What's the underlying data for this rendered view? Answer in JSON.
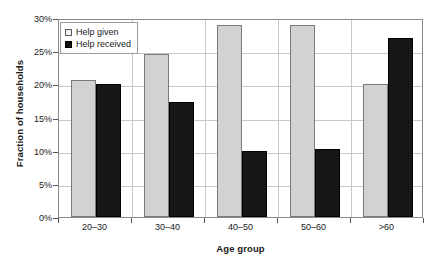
{
  "chart_data": {
    "type": "bar",
    "title": "",
    "subtitle": "",
    "xlabel": "Age group",
    "ylabel": "Fraction of households",
    "categories": [
      "20–30",
      "30–40",
      "40–50",
      "50–60",
      ">60"
    ],
    "series": [
      {
        "name": "Help given",
        "color": "#d2d2d2",
        "values": [
          20.6,
          24.6,
          29.0,
          29.0,
          20.0
        ]
      },
      {
        "name": "Help received",
        "color": "#161616",
        "values": [
          20.0,
          17.3,
          10.0,
          10.3,
          27.0
        ]
      }
    ],
    "ylim": [
      0,
      30
    ],
    "ytick_values": [
      0,
      5,
      10,
      15,
      20,
      25,
      30
    ],
    "ytick_labels": [
      "0%",
      "5%",
      "10%",
      "15%",
      "20%",
      "25%",
      "30%"
    ],
    "y_unit": "%",
    "grid": "horizontal-and-vertical",
    "legend_position": "top-left-inside",
    "legend": [
      {
        "label": "Help given",
        "swatch": "light-gray-square"
      },
      {
        "label": "Help received",
        "swatch": "black-square"
      }
    ]
  }
}
